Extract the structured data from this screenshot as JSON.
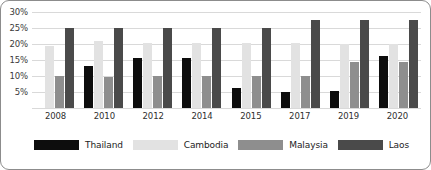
{
  "chart_data": {
    "type": "bar",
    "title": "",
    "subtitle": "",
    "xlabel": "",
    "ylabel": "",
    "categories": [
      "2008",
      "2010",
      "2012",
      "2014",
      "2015",
      "2017",
      "2019",
      "2020"
    ],
    "ylim": [
      0,
      30
    ],
    "ytick_labels": [
      "30%",
      "25%",
      "20%",
      "15%",
      "10%",
      "5%"
    ],
    "ytick_values": [
      30,
      25,
      20,
      15,
      10,
      5
    ],
    "grid": true,
    "legend_position": "bottom",
    "value_suffix": "%",
    "series": [
      {
        "name": "Thailand",
        "color": "#0d0d0d",
        "values": [
          null,
          13.2,
          15.6,
          15.6,
          6.1,
          5.0,
          5.4,
          16.2
        ]
      },
      {
        "name": "Cambodia",
        "color": "#e2e2e2",
        "values": [
          19.4,
          21.0,
          20.2,
          20.2,
          20.2,
          20.2,
          20.0,
          20.0
        ]
      },
      {
        "name": "Malaysia",
        "color": "#8e8e8e",
        "values": [
          9.9,
          9.8,
          10.1,
          10.1,
          10.1,
          10.1,
          14.4,
          14.4
        ]
      },
      {
        "name": "Laos",
        "color": "#4a4a4a",
        "values": [
          25.1,
          25.1,
          24.9,
          24.9,
          24.9,
          27.5,
          27.5,
          27.6
        ]
      }
    ]
  },
  "colors": {
    "border": "#8c8c8c",
    "gridline": "#d9d9d9",
    "background": "#ffffff",
    "tick_text": "#3a3a3a",
    "legend_text": "#232323"
  }
}
